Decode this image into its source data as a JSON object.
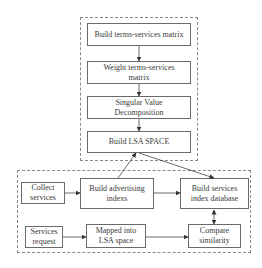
{
  "diagram": {
    "lsa_group": {
      "steps": [
        {
          "id": "build-terms-services-matrix",
          "label": "Build terms-services matrix"
        },
        {
          "id": "weight-terms-services-matrix",
          "label": "Weight terms-services matrix"
        },
        {
          "id": "singular-value-decomposition",
          "label": "Singular Value Decomposition"
        },
        {
          "id": "build-lsa-space",
          "label": "Build LSA SPACE"
        }
      ]
    },
    "service_group": {
      "nodes": [
        {
          "id": "collect-services",
          "label": "Collect services"
        },
        {
          "id": "build-advertising-indexs",
          "label": "Build advertising indexs"
        },
        {
          "id": "build-services-index-database",
          "label": "Build services index database"
        },
        {
          "id": "services-request",
          "label": "Services request"
        },
        {
          "id": "mapped-into-lsa-space",
          "label": "Mapped into LSA space"
        },
        {
          "id": "compare-similarity",
          "label": "Compare similarity"
        }
      ]
    },
    "edges": [
      {
        "from": "build-terms-services-matrix",
        "to": "weight-terms-services-matrix"
      },
      {
        "from": "weight-terms-services-matrix",
        "to": "singular-value-decomposition"
      },
      {
        "from": "singular-value-decomposition",
        "to": "build-lsa-space"
      },
      {
        "from": "build-advertising-indexs",
        "to": "build-lsa-space"
      },
      {
        "from": "build-lsa-space",
        "to": "build-services-index-database"
      },
      {
        "from": "collect-services",
        "to": "build-advertising-indexs"
      },
      {
        "from": "build-advertising-indexs",
        "to": "build-services-index-database"
      },
      {
        "from": "build-services-index-database",
        "to": "compare-similarity",
        "bidirectional": true
      },
      {
        "from": "services-request",
        "to": "mapped-into-lsa-space"
      },
      {
        "from": "mapped-into-lsa-space",
        "to": "compare-similarity"
      }
    ]
  }
}
